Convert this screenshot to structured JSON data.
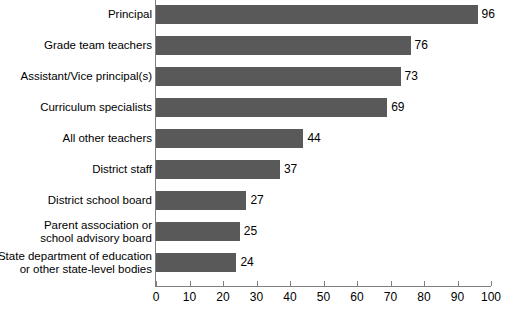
{
  "chart_data": {
    "type": "bar",
    "orientation": "horizontal",
    "title": "",
    "xlabel": "",
    "ylabel": "",
    "xlim": [
      0,
      100
    ],
    "xticks": [
      0,
      10,
      20,
      30,
      40,
      50,
      60,
      70,
      80,
      90,
      100
    ],
    "grid": false,
    "legend": null,
    "bar_color": "#595959",
    "axis_color": "#808080",
    "background_color": "#ffffff",
    "categories": [
      "Principal",
      "Grade team teachers",
      "Assistant/Vice principal(s)",
      "Curriculum specialists",
      "All other teachers",
      "District staff",
      "District school board",
      "Parent association or\nschool advisory board",
      "State department of education\nor other state-level bodies"
    ],
    "values": [
      96,
      76,
      73,
      69,
      44,
      37,
      27,
      25,
      24
    ],
    "data_labels": [
      "96",
      "76",
      "73",
      "69",
      "44",
      "37",
      "27",
      "25",
      "24"
    ]
  }
}
